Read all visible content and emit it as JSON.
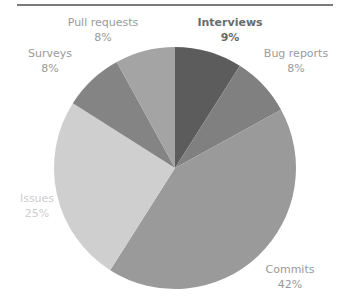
{
  "chart_data": {
    "type": "pie",
    "title": "",
    "start_angle_deg": 0,
    "direction": "clockwise",
    "categories": [
      "Interviews",
      "Bug reports",
      "Commits",
      "Issues",
      "Surveys",
      "Pull requests"
    ],
    "values": [
      9,
      8,
      42,
      25,
      8,
      8
    ],
    "value_labels": [
      "9%",
      "8%",
      "42%",
      "25%",
      "8%",
      "8%"
    ],
    "colors": [
      "#5c5c5c",
      "#808080",
      "#9a9a9a",
      "#cfcfcf",
      "#848484",
      "#a4a4a4"
    ],
    "legend": "none (data labels outside slices)"
  },
  "labels": [
    {
      "name": "Interviews",
      "pct": "9%"
    },
    {
      "name": "Bug reports",
      "pct": "8%"
    },
    {
      "name": "Commits",
      "pct": "42%"
    },
    {
      "name": "Issues",
      "pct": "25%"
    },
    {
      "name": "Surveys",
      "pct": "8%"
    },
    {
      "name": "Pull requests",
      "pct": "8%"
    }
  ]
}
